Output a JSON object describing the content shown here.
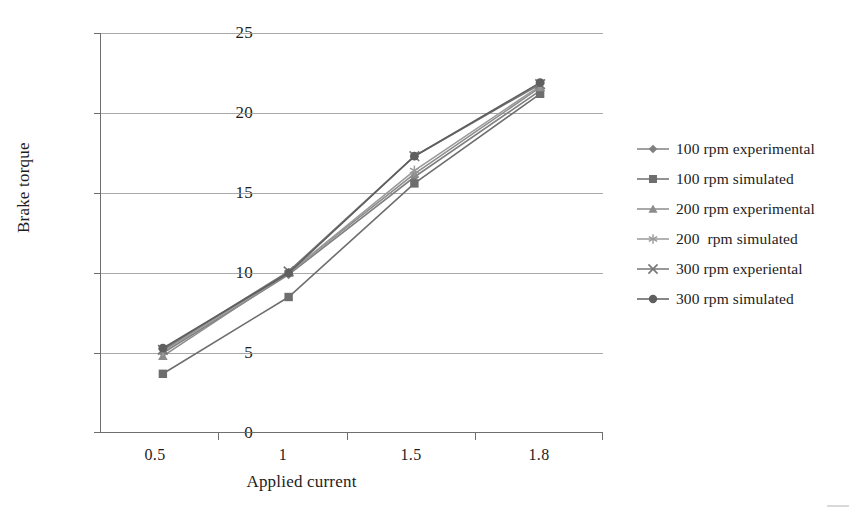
{
  "chart_data": {
    "type": "line",
    "title": "",
    "xlabel": "Applied current",
    "ylabel": "Brake torque",
    "categories": [
      "0.5",
      "1",
      "1.5",
      "1.8"
    ],
    "ylim": [
      0,
      25
    ],
    "yticks": [
      0,
      5,
      10,
      15,
      20,
      25
    ],
    "grid": true,
    "legend_position": "right",
    "series": [
      {
        "name": "100 rpm experimental",
        "marker": "diamond",
        "color": "#808080",
        "values": [
          5.0,
          9.9,
          16.0,
          21.4
        ]
      },
      {
        "name": "100 rpm simulated",
        "marker": "square",
        "color": "#6e6e6e",
        "values": [
          3.7,
          8.5,
          15.6,
          21.2
        ]
      },
      {
        "name": "200 rpm experimental",
        "marker": "triangle",
        "color": "#8c8c8c",
        "values": [
          4.8,
          10.0,
          16.2,
          21.6
        ]
      },
      {
        "name": "200  rpm simulated",
        "marker": "asterisk",
        "color": "#9a9a9a",
        "values": [
          5.1,
          10.0,
          16.4,
          21.7
        ]
      },
      {
        "name": "300 rpm experiental",
        "marker": "cross",
        "color": "#777777",
        "values": [
          5.2,
          10.1,
          17.3,
          21.8
        ]
      },
      {
        "name": "300 rpm simulated",
        "marker": "circle",
        "color": "#5f5f5f",
        "values": [
          5.3,
          10.0,
          17.3,
          21.9
        ]
      }
    ]
  },
  "axes": {
    "y_labels": [
      "25",
      "20",
      "15",
      "10",
      "5",
      "0"
    ],
    "x_labels": [
      "0.5",
      "1",
      "1.5",
      "1.8"
    ],
    "x_title": "Applied current",
    "y_title": "Brake torque"
  },
  "legend": {
    "items": [
      {
        "label": "100 rpm experimental",
        "marker": "diamond-marker-icon"
      },
      {
        "label": "100 rpm simulated",
        "marker": "square-marker-icon"
      },
      {
        "label": "200 rpm experimental",
        "marker": "triangle-marker-icon"
      },
      {
        "label": "200  rpm simulated",
        "marker": "asterisk-marker-icon"
      },
      {
        "label": "300 rpm experiental",
        "marker": "cross-marker-icon"
      },
      {
        "label": "300 rpm simulated",
        "marker": "circle-marker-icon"
      }
    ]
  },
  "style": {
    "grid_color": "#9a9a9a",
    "axis_color": "#6e6e6e",
    "text_color": "#1d1d1d",
    "background": "#ffffff"
  }
}
